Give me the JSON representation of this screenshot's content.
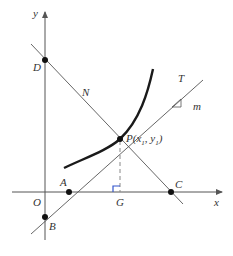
{
  "diagram": {
    "axes": {
      "x_label": "x",
      "y_label": "y",
      "origin_label": "O"
    },
    "points": {
      "D": "D",
      "N": "N",
      "T": "T",
      "m": "m",
      "P": "P(x",
      "P_sub1": "1",
      "P_mid": ", y",
      "P_sub2": "1",
      "P_end": ")",
      "A": "A",
      "G": "G",
      "C": "C",
      "B": "B"
    },
    "colors": {
      "axis": "#555555",
      "curve": "#1a1a1a",
      "line": "#555555",
      "point": "#111111",
      "dashed": "#888888",
      "right_angle": "#3355cc"
    }
  }
}
